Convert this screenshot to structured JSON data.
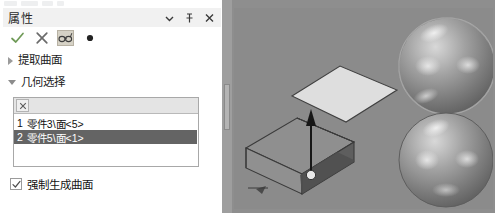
{
  "panel": {
    "title": "属性",
    "title_buttons": [
      {
        "name": "dropdown",
        "icon": "chevron-down-icon"
      },
      {
        "name": "pin",
        "icon": "pin-icon"
      },
      {
        "name": "close",
        "icon": "close-icon"
      }
    ],
    "toolbar": [
      {
        "name": "accept",
        "icon": "check-icon",
        "color": "#6f9a57",
        "active": false
      },
      {
        "name": "cancel",
        "icon": "x-icon",
        "color": "#6b6b6b",
        "active": false
      },
      {
        "name": "preview",
        "icon": "glasses-icon",
        "color": "#4a4a4a",
        "active": true
      },
      {
        "name": "help",
        "icon": "dot-icon",
        "color": "#2a2a2a",
        "active": false
      }
    ],
    "sections": [
      {
        "label": "提取曲面",
        "expanded": false
      },
      {
        "label": "几何选择",
        "expanded": true
      }
    ],
    "selection_box": {
      "clear_label": "×",
      "items": [
        {
          "index": "1",
          "label": "零件3\\面<5>",
          "selected": false
        },
        {
          "index": "2",
          "label": "零件5\\面<1>",
          "selected": true
        }
      ]
    },
    "checkbox": {
      "label": "强制生成曲面",
      "checked": true,
      "mark": "✓"
    }
  },
  "viewport": {
    "name": "3d-graphics-area",
    "background": "#8b8b8b",
    "objects": [
      {
        "name": "detached-top-face",
        "type": "plane"
      },
      {
        "name": "box-body",
        "type": "box"
      },
      {
        "name": "direction-arrow",
        "type": "arrow"
      },
      {
        "name": "sphere-top",
        "type": "sphere"
      },
      {
        "name": "sphere-bottom",
        "type": "sphere"
      }
    ]
  },
  "colors": {
    "selection_highlight": "#646464",
    "panel_header": "#f1f1f1",
    "accept_green": "#6f9a57",
    "viewport_bg": "#8b8b8b"
  }
}
